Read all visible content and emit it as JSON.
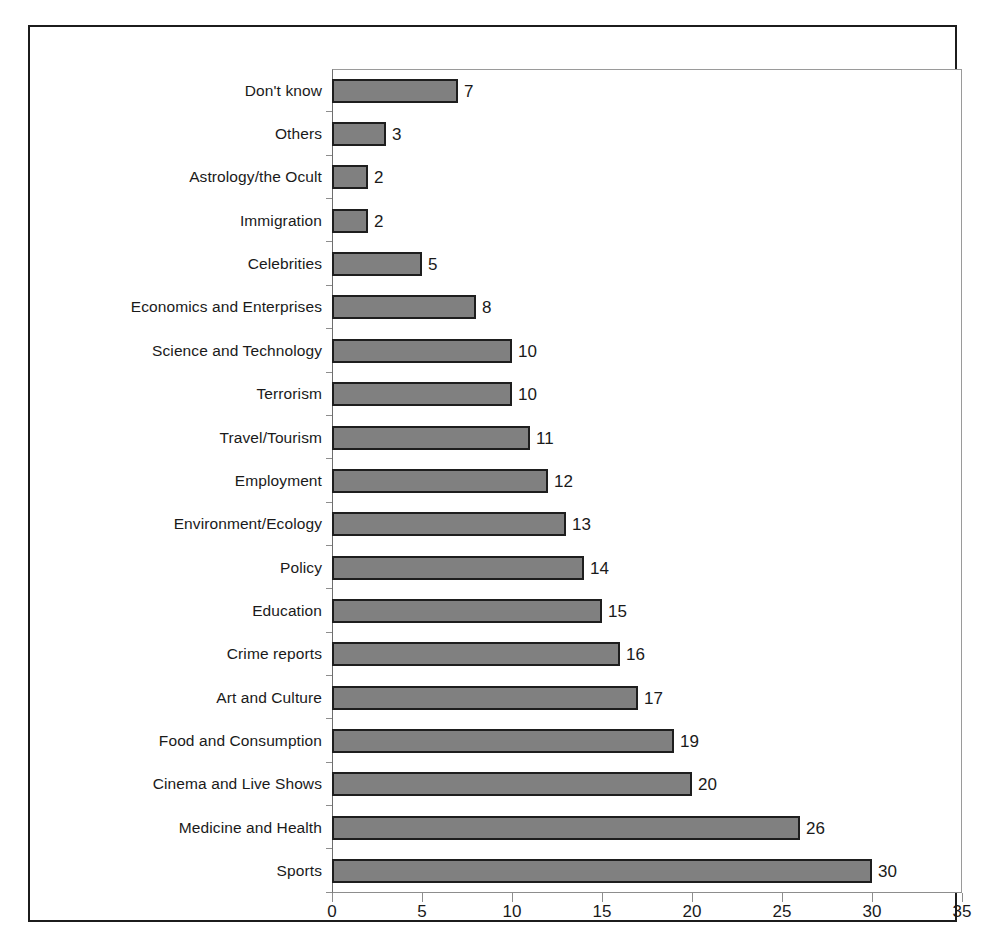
{
  "chart_data": {
    "type": "bar",
    "orientation": "horizontal",
    "title": "",
    "subtitle": "",
    "xlabel": "",
    "ylabel": "",
    "xlim": [
      0,
      35
    ],
    "xticks": [
      0,
      5,
      10,
      15,
      20,
      25,
      30,
      35
    ],
    "xtick_labels": [
      "0",
      "5",
      "10",
      "15",
      "20",
      "25",
      "30",
      "35"
    ],
    "grid": false,
    "legend": false,
    "legend_position": "none",
    "bar_color": "#808080",
    "bar_edge_color": "#1e1e1e",
    "frame_color": "#1c1c1c",
    "axis_color": "#8d8d8d",
    "text_color": "#1a1a1a",
    "background": "#ffffff",
    "data_labels": true,
    "categories": [
      "Don't know",
      "Others",
      "Astrology/the Ocult",
      "Immigration",
      "Celebrities",
      "Economics and Enterprises",
      "Science and Technology",
      "Terrorism",
      "Travel/Tourism",
      "Employment",
      "Environment/Ecology",
      "Policy",
      "Education",
      "Crime reports",
      "Art and Culture",
      "Food and Consumption",
      "Cinema and Live Shows",
      "Medicine and Health",
      "Sports"
    ],
    "values": [
      7,
      3,
      2,
      2,
      5,
      8,
      10,
      10,
      11,
      12,
      13,
      14,
      15,
      16,
      17,
      19,
      20,
      26,
      30
    ],
    "value_labels": [
      "7",
      "3",
      "2",
      "2",
      "5",
      "8",
      "10",
      "10",
      "11",
      "12",
      "13",
      "14",
      "15",
      "16",
      "17",
      "19",
      "20",
      "26",
      "30"
    ]
  }
}
